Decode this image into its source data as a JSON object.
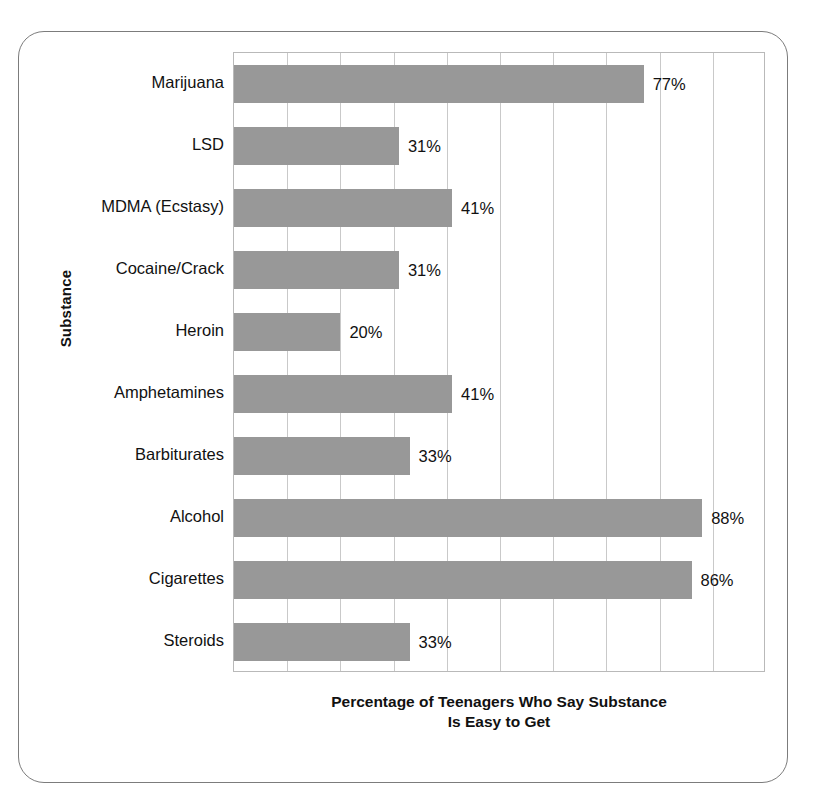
{
  "chart_data": {
    "type": "bar",
    "orientation": "horizontal",
    "title": "",
    "xlabel_line1": "Percentage of Teenagers Who Say Substance",
    "xlabel_line2": "Is Easy to Get",
    "ylabel": "Substance",
    "categories": [
      "Marijuana",
      "LSD",
      "MDMA (Ecstasy)",
      "Cocaine/Crack",
      "Heroin",
      "Amphetamines",
      "Barbiturates",
      "Alcohol",
      "Cigarettes",
      "Steroids"
    ],
    "values": [
      77,
      31,
      41,
      31,
      20,
      41,
      33,
      88,
      86,
      33
    ],
    "value_labels": [
      "77%",
      "31%",
      "41%",
      "31%",
      "20%",
      "41%",
      "33%",
      "88%",
      "86%",
      "33%"
    ],
    "xlim": [
      0,
      100
    ],
    "xticks": [
      0,
      10,
      20,
      30,
      40,
      50,
      60,
      70,
      80,
      90,
      100
    ],
    "xtick_labels": [],
    "grid": true,
    "grid_axis": "x",
    "legend": false,
    "bar_color": "#989898",
    "grid_color": "#c9c9c9",
    "axis_color": "#b9b9b9",
    "frame_color": "#7c7c7c",
    "text_color": "#111111"
  }
}
